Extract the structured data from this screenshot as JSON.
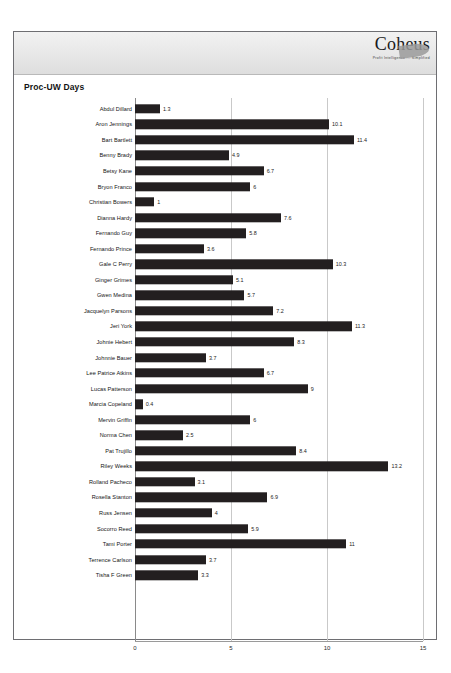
{
  "header": {
    "logo_word": "Coheus",
    "logo_tagline": "Profit Intelligence ... Simplified",
    "swoosh_icon": "swoosh-icon"
  },
  "chart_data": {
    "type": "bar",
    "orientation": "horizontal",
    "title": "Proc-UW Days",
    "xlabel": "",
    "ylabel": "",
    "xlim": [
      0,
      15
    ],
    "xticks": [
      "0",
      "5",
      "10",
      "15"
    ],
    "xtick_values": [
      0,
      5,
      10,
      15
    ],
    "grid": true,
    "legend": "none",
    "bar_color": "#231f20",
    "data_labels": true,
    "categories": [
      "Abdul Dillard",
      "Aron Jennings",
      "Bart Bartlett",
      "Benny Brady",
      "Betsy Kane",
      "Bryon Franco",
      "Christian Bowers",
      "Dianna Hardy",
      "Fernando Guy",
      "Fernando Prince",
      "Gale C Perry",
      "Ginger Grimes",
      "Gwen Medina",
      "Jacquelyn Parsons",
      "Jeri York",
      "Johnie Hebert",
      "Johnnie Bauer",
      "Lee Patrice Atkins",
      "Lucas Patterson",
      "Marcia Copeland",
      "Mervin Griffin",
      "Norma Chen",
      "Pat Trujillo",
      "Riley Weeks",
      "Rolland Pacheco",
      "Rosella Stanton",
      "Russ Jensen",
      "Socorro Reed",
      "Tami Porter",
      "Terrence Carlson",
      "Tisha F Green"
    ],
    "values": [
      1.3,
      10.1,
      11.4,
      4.9,
      6.7,
      6,
      1,
      7.6,
      5.8,
      3.6,
      10.3,
      5.1,
      5.7,
      7.2,
      11.3,
      8.3,
      3.7,
      6.7,
      9,
      0.4,
      6,
      2.5,
      8.4,
      13.2,
      3.1,
      6.9,
      4,
      5.9,
      11,
      3.7,
      3.3
    ],
    "value_labels": [
      "1.3",
      "10.1",
      "11.4",
      "4.9",
      "6.7",
      "6",
      "1",
      "7.6",
      "5.8",
      "3.6",
      "10.3",
      "5.1",
      "5.7",
      "7.2",
      "11.3",
      "8.3",
      "3.7",
      "6.7",
      "9",
      "0.4",
      "6",
      "2.5",
      "8.4",
      "13.2",
      "3.1",
      "6.9",
      "4",
      "5.9",
      "11",
      "3.7",
      "3.3"
    ]
  }
}
